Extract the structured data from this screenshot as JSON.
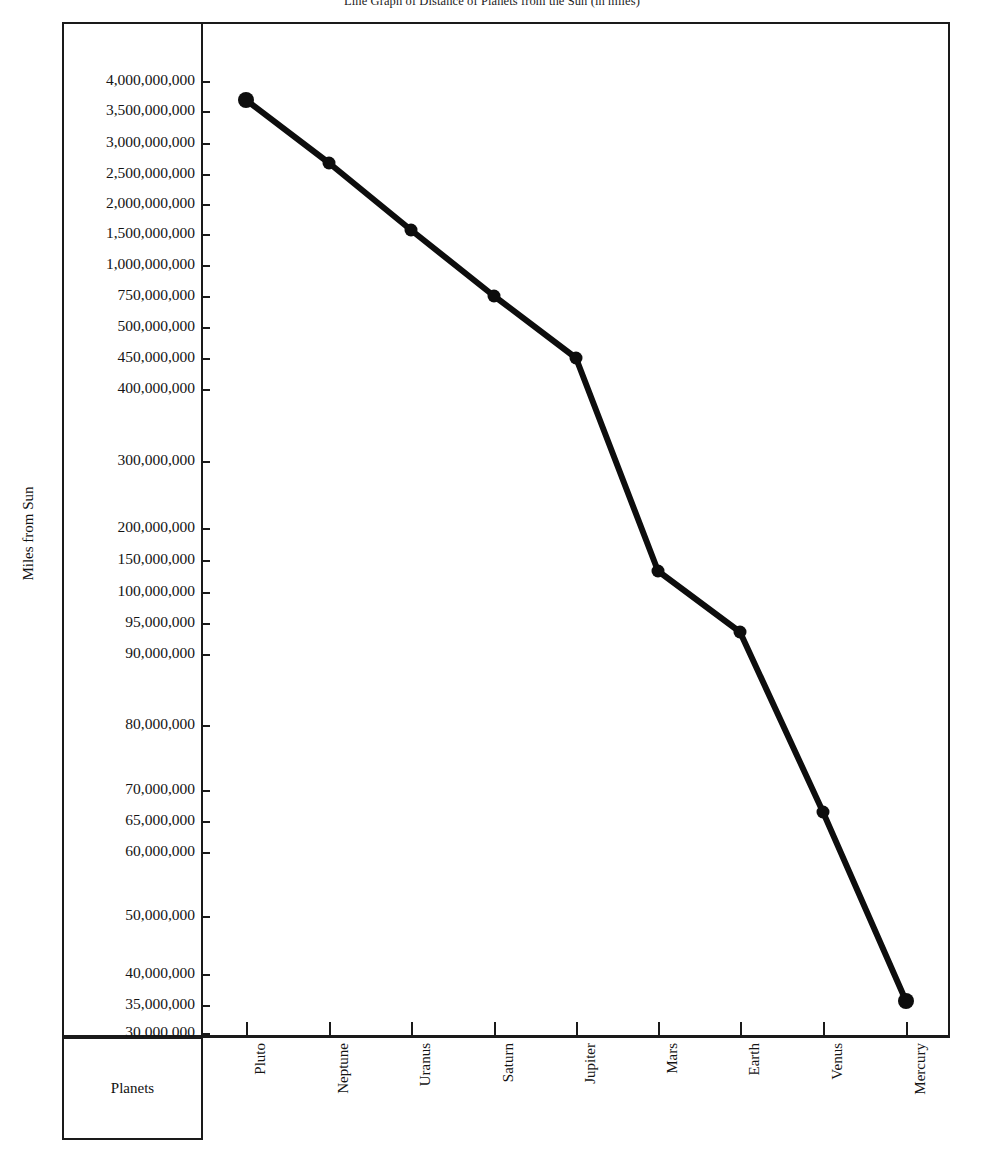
{
  "title": "Line Graph of Distance of Planets from the Sun (in miles)",
  "axes": {
    "y_title": "Miles from Sun",
    "x_title": "Planets"
  },
  "y_ticks": [
    {
      "label": "4,000,000,000",
      "value": 4000000000,
      "y": 81
    },
    {
      "label": "3,500,000,000",
      "value": 3500000000,
      "y": 111
    },
    {
      "label": "3,000,000,000",
      "value": 3000000000,
      "y": 143
    },
    {
      "label": "2,500,000,000",
      "value": 2500000000,
      "y": 174
    },
    {
      "label": "2,000,000,000",
      "value": 2000000000,
      "y": 204
    },
    {
      "label": "1,500,000,000",
      "value": 1500000000,
      "y": 234
    },
    {
      "label": "1,000,000,000",
      "value": 1000000000,
      "y": 265
    },
    {
      "label": "750,000,000",
      "value": 750000000,
      "y": 296
    },
    {
      "label": "500,000,000",
      "value": 500000000,
      "y": 327
    },
    {
      "label": "450,000,000",
      "value": 450000000,
      "y": 358
    },
    {
      "label": "400,000,000",
      "value": 400000000,
      "y": 389
    },
    {
      "label": "300,000,000",
      "value": 300000000,
      "y": 461
    },
    {
      "label": "200,000,000",
      "value": 200000000,
      "y": 528
    },
    {
      "label": "150,000,000",
      "value": 150000000,
      "y": 560
    },
    {
      "label": "100,000,000",
      "value": 100000000,
      "y": 592
    },
    {
      "label": "95,000,000",
      "value": 95000000,
      "y": 623
    },
    {
      "label": "90,000,000",
      "value": 90000000,
      "y": 654
    },
    {
      "label": "80,000,000",
      "value": 80000000,
      "y": 725
    },
    {
      "label": "70,000,000",
      "value": 70000000,
      "y": 790
    },
    {
      "label": "65,000,000",
      "value": 65000000,
      "y": 821
    },
    {
      "label": "60,000,000",
      "value": 60000000,
      "y": 852
    },
    {
      "label": "50,000,000",
      "value": 50000000,
      "y": 916
    },
    {
      "label": "40,000,000",
      "value": 40000000,
      "y": 974
    },
    {
      "label": "35,000,000",
      "value": 35000000,
      "y": 1005
    },
    {
      "label": "30,000,000",
      "value": 30000000,
      "y": 1033
    }
  ],
  "x_ticks": [
    {
      "label": "Pluto",
      "x": 246
    },
    {
      "label": "Neptune",
      "x": 329
    },
    {
      "label": "Uranus",
      "x": 411
    },
    {
      "label": "Saturn",
      "x": 494
    },
    {
      "label": "Jupiter",
      "x": 576
    },
    {
      "label": "Mars",
      "x": 658
    },
    {
      "label": "Earth",
      "x": 740
    },
    {
      "label": "Venus",
      "x": 823
    },
    {
      "label": "Mercury",
      "x": 906
    }
  ],
  "chart_data": {
    "type": "line",
    "title": "Line Graph of Distance of Planets from the Sun (in miles)",
    "xlabel": "Planets",
    "ylabel": "Miles from Sun",
    "grid": false,
    "legend": "none",
    "y_axis_scale": "ordinal / non-linear (unequally spaced labeled ticks)",
    "y_axis_range_labels": [
      "30,000,000",
      "4,000,000,000"
    ],
    "categories": [
      "Pluto",
      "Neptune",
      "Uranus",
      "Saturn",
      "Jupiter",
      "Mars",
      "Earth",
      "Venus",
      "Mercury"
    ],
    "values": [
      3670000000,
      2790000000,
      1780000000,
      885000000,
      483000000,
      142000000,
      93000000,
      67000000,
      36000000
    ],
    "value_labels": [
      "3,670,000,000",
      "2,790,000,000",
      "1,780,000,000",
      "885,000,000",
      "483,000,000",
      "142,000,000",
      "93,000,000",
      "67,000,000",
      "36,000,000"
    ],
    "points_px": [
      {
        "category": "Pluto",
        "x": 246,
        "y": 100
      },
      {
        "category": "Neptune",
        "x": 329,
        "y": 163
      },
      {
        "category": "Uranus",
        "x": 411,
        "y": 230
      },
      {
        "category": "Saturn",
        "x": 494,
        "y": 296
      },
      {
        "category": "Jupiter",
        "x": 576,
        "y": 358
      },
      {
        "category": "Mars",
        "x": 658,
        "y": 571
      },
      {
        "category": "Earth",
        "x": 740,
        "y": 632
      },
      {
        "category": "Venus",
        "x": 823,
        "y": 812
      },
      {
        "category": "Mercury",
        "x": 906,
        "y": 1001
      }
    ],
    "series_color": "#0d0d0d",
    "marker": "filled-circle"
  },
  "colors": {
    "line": "#0d0d0d",
    "axis": "#1a1a1a",
    "text": "#141414",
    "background": "#ffffff"
  }
}
